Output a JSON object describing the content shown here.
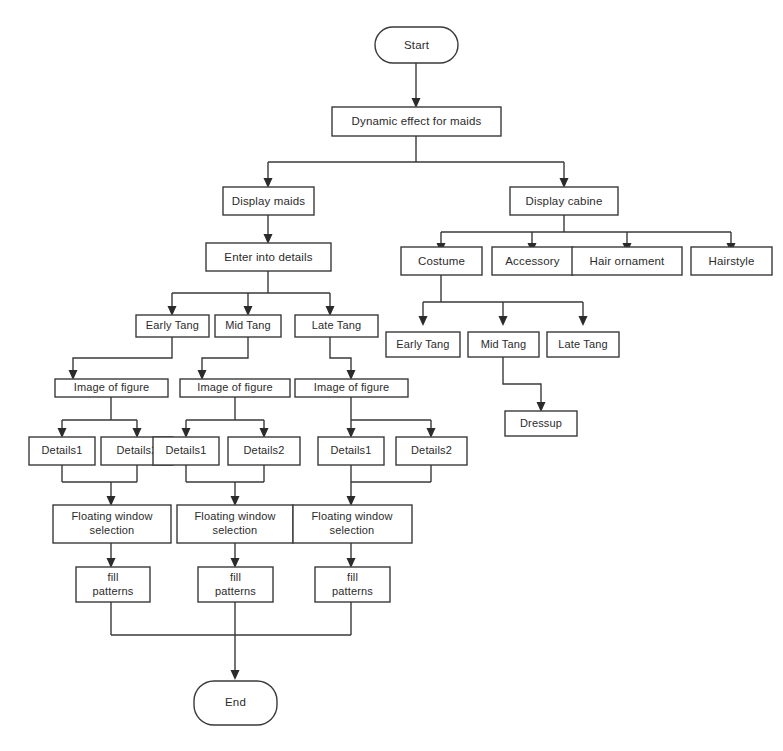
{
  "diagram": {
    "background_color": "#ffffff",
    "line_color": "#3a3a3a",
    "text_color": "#2b2b2b",
    "nodes": {
      "start": {
        "label": "Start",
        "shape": "terminator"
      },
      "dynamic_effect": {
        "label": "Dynamic effect for maids",
        "shape": "process"
      },
      "display_maids": {
        "label": "Display maids",
        "shape": "process"
      },
      "display_cabine": {
        "label": "Display cabine",
        "shape": "process"
      },
      "enter_details": {
        "label": "Enter into details",
        "shape": "process"
      },
      "costume": {
        "label": "Costume",
        "shape": "process"
      },
      "accessory": {
        "label": "Accessory",
        "shape": "process"
      },
      "hair_ornament": {
        "label": "Hair ornament",
        "shape": "process"
      },
      "hairstyle": {
        "label": "Hairstyle",
        "shape": "process"
      },
      "left_early_tang": {
        "label": "Early Tang",
        "shape": "process"
      },
      "left_mid_tang": {
        "label": "Mid Tang",
        "shape": "process"
      },
      "left_late_tang": {
        "label": "Late Tang",
        "shape": "process"
      },
      "right_early_tang": {
        "label": "Early Tang",
        "shape": "process"
      },
      "right_mid_tang": {
        "label": "Mid Tang",
        "shape": "process"
      },
      "right_late_tang": {
        "label": "Late Tang",
        "shape": "process"
      },
      "dressup": {
        "label": "Dressup",
        "shape": "process"
      },
      "image_figure_1": {
        "label": "Image of figure",
        "shape": "process"
      },
      "image_figure_2": {
        "label": "Image of figure",
        "shape": "process"
      },
      "image_figure_3": {
        "label": "Image of figure",
        "shape": "process"
      },
      "details1_a": {
        "label": "Details1",
        "shape": "process"
      },
      "details2_a": {
        "label": "Details2",
        "shape": "process"
      },
      "details1_b": {
        "label": "Details1",
        "shape": "process"
      },
      "details2_b": {
        "label": "Details2",
        "shape": "process"
      },
      "details1_c": {
        "label": "Details1",
        "shape": "process"
      },
      "details2_c": {
        "label": "Details2",
        "shape": "process"
      },
      "floating_1_line1": {
        "label": "Floating window",
        "shape": "process"
      },
      "floating_1_line2": {
        "label": "selection",
        "shape": "process"
      },
      "floating_2_line1": {
        "label": "Floating window",
        "shape": "process"
      },
      "floating_2_line2": {
        "label": "selection",
        "shape": "process"
      },
      "floating_3_line1": {
        "label": "Floating window",
        "shape": "process"
      },
      "floating_3_line2": {
        "label": "selection",
        "shape": "process"
      },
      "fill_1_line1": {
        "label": "fill",
        "shape": "process"
      },
      "fill_1_line2": {
        "label": "patterns",
        "shape": "process"
      },
      "fill_2_line1": {
        "label": "fill",
        "shape": "process"
      },
      "fill_2_line2": {
        "label": "patterns",
        "shape": "process"
      },
      "fill_3_line1": {
        "label": "fill",
        "shape": "process"
      },
      "fill_3_line2": {
        "label": "patterns",
        "shape": "process"
      },
      "end": {
        "label": "End",
        "shape": "terminator"
      }
    }
  }
}
